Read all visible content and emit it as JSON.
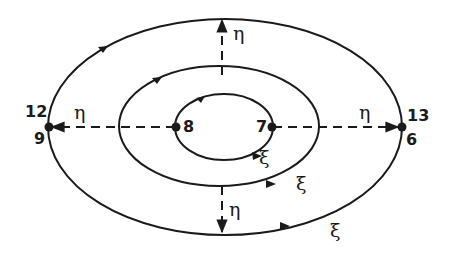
{
  "diagram": {
    "type": "nested elliptical contours with coordinate axes",
    "colors": {
      "ink": "#1a1a1a",
      "background": "#ffffff"
    },
    "nodes": [
      {
        "id": "n8",
        "label": "8",
        "position": "left end of inner ellipse"
      },
      {
        "id": "n7",
        "label": "7",
        "position": "right end of inner ellipse"
      },
      {
        "id": "n12_9",
        "label_top": "12",
        "label_bottom": "9",
        "position": "left end of outer ellipse"
      },
      {
        "id": "n13_6",
        "label_top": "13",
        "label_bottom": "6",
        "position": "right end of outer ellipse"
      }
    ],
    "axis_labels": {
      "eta_left": "η",
      "eta_right": "η",
      "eta_top": "η",
      "eta_bottom": "η"
    },
    "contour_labels": {
      "xi_inner": "ξ",
      "xi_middle": "ξ",
      "xi_outer": "ξ"
    },
    "arrows": [
      {
        "from": "n8",
        "to": "n12_9",
        "style": "dashed",
        "label": "η"
      },
      {
        "from": "n7",
        "to": "n13_6",
        "style": "dashed",
        "label": "η"
      },
      {
        "from": "center",
        "to": "outer-top",
        "style": "dashed",
        "label": "η"
      },
      {
        "from": "center",
        "to": "outer-bottom",
        "style": "dashed",
        "label": "η"
      }
    ]
  }
}
